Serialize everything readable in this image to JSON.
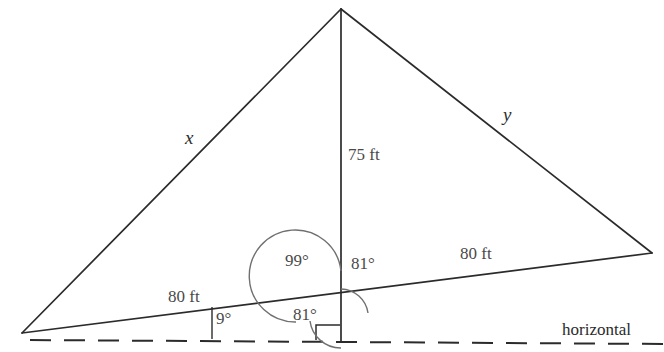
{
  "figure": {
    "type": "geometry-diagram",
    "stroke_color": "#2b2b2b",
    "text_color": "#4a4a4a"
  },
  "labels": {
    "side_x": "x",
    "side_y": "y",
    "altitude": "75 ft",
    "base_left": "80 ft",
    "base_right": "80 ft",
    "angle_slope": "9°",
    "angle_obtuse_left": "99°",
    "angle_right_upper": "81°",
    "angle_lower_left": "81°",
    "horizontal": "horizontal"
  },
  "geometry": {
    "apex": {
      "x": 341,
      "y": 9
    },
    "left_vertex": {
      "x": 22,
      "y": 333
    },
    "right_vertex": {
      "x": 652,
      "y": 253
    },
    "altitude_foot": {
      "x": 341,
      "y": 338
    },
    "base_intersection": {
      "x": 341,
      "y": 317
    },
    "horizontal_line": {
      "x1": 30,
      "y1": 340,
      "x2": 664,
      "y2": 344
    },
    "slope_tick": {
      "x": 212,
      "y_top": 305,
      "y_bottom": 339
    }
  }
}
